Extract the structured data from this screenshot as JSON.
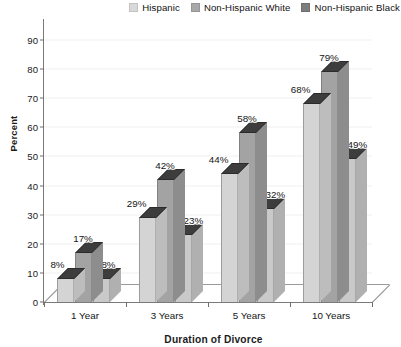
{
  "chart_data": {
    "type": "bar",
    "title": "",
    "subtitle": "",
    "xlabel": "Duration of Divorce",
    "ylabel": "Percent",
    "categories": [
      "1 Year",
      "3 Years",
      "5 Years",
      "10 Years"
    ],
    "series": [
      {
        "name": "Hispanic",
        "color": "#d4d4d4",
        "side_color": "#bdbdbd",
        "values": [
          8,
          17,
          44,
          68
        ],
        "labels": [
          "8%",
          "29%",
          "44%",
          "68%"
        ],
        "values_by_category": [
          8,
          29,
          44,
          68
        ]
      },
      {
        "name": "Non-Hispanic White",
        "color": "#a3a3a3",
        "side_color": "#8d8d8d",
        "values": [
          17,
          42,
          58,
          79
        ],
        "labels": [
          "17%",
          "42%",
          "58%",
          "79%"
        ],
        "values_by_category": [
          17,
          42,
          58,
          79
        ]
      },
      {
        "name": "Non-Hispanic Black",
        "color": "#c9c9c9",
        "side_color": "#b0b0b0",
        "values": [
          8,
          23,
          32,
          49
        ],
        "labels": [
          "8%",
          "23%",
          "32%",
          "49%"
        ],
        "values_by_category": [
          8,
          23,
          32,
          49
        ]
      }
    ],
    "ylim": [
      0,
      90
    ],
    "ytick_step": 10,
    "ytick_labels": [
      "0",
      "10",
      "20",
      "30",
      "40",
      "50",
      "60",
      "70",
      "80",
      "90"
    ],
    "grid": true,
    "legend_position": "top-right",
    "three_d": true,
    "data_labels": {
      "1 Year": [
        "8%",
        "17%",
        "8%"
      ],
      "3 Years": [
        "29%",
        "42%",
        "23%"
      ],
      "5 Years": [
        "44%",
        "58%",
        "32%"
      ],
      "10 Years": [
        "68%",
        "79%",
        "49%"
      ]
    }
  },
  "legend": {
    "items": [
      {
        "label": "Hispanic",
        "color": "#d9d9d9"
      },
      {
        "label": "Non-Hispanic White",
        "color": "#a8a8a8"
      },
      {
        "label": "Non-Hispanic Black",
        "color": "#7d7d7d"
      }
    ]
  },
  "axes": {
    "y_title": "Percent",
    "x_title": "Duration of Divorce"
  }
}
